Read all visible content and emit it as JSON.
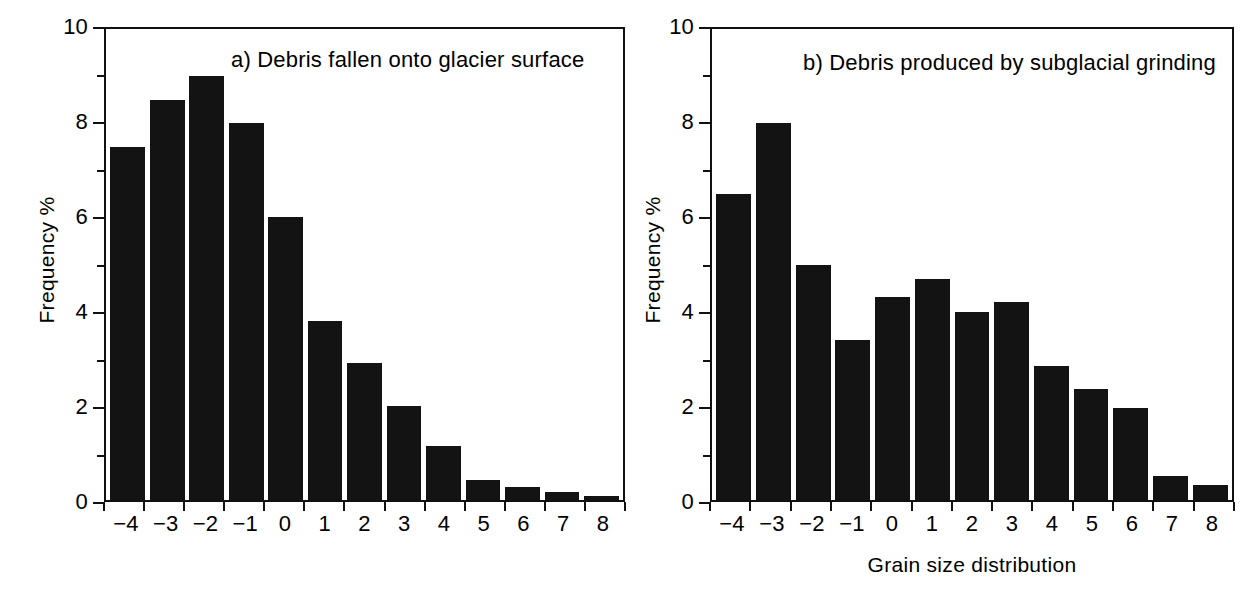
{
  "figure": {
    "background": "#ffffff",
    "bar_color": "#131313",
    "axis_color": "#111111"
  },
  "chart_data": [
    {
      "type": "bar",
      "title": "a) Debris fallen onto glacier surface",
      "panel_letter": "a)",
      "xlabel": "",
      "ylabel": "Frequency %",
      "categories": [
        "-4",
        "-3",
        "-2",
        "-1",
        "0",
        "1",
        "2",
        "3",
        "4",
        "5",
        "6",
        "7",
        "8"
      ],
      "values": [
        7.5,
        8.5,
        9.0,
        8.0,
        6.0,
        3.8,
        2.9,
        2.0,
        1.15,
        0.42,
        0.28,
        0.17,
        0.08
      ],
      "ylim": [
        0,
        10
      ],
      "ytick_major": [
        0,
        2,
        4,
        6,
        8,
        10
      ],
      "ytick_minor": [
        1,
        3,
        5,
        7,
        9
      ],
      "ytick_labels": [
        "0",
        "2",
        "4",
        "6",
        "8",
        "10"
      ],
      "grid": false,
      "legend": "none"
    },
    {
      "type": "bar",
      "title": "b) Debris produced by subglacial grinding",
      "panel_letter": "b)",
      "xlabel": "Grain size distribution",
      "ylabel": "Frequency %",
      "categories": [
        "-4",
        "-3",
        "-2",
        "-1",
        "0",
        "1",
        "2",
        "3",
        "4",
        "5",
        "6",
        "7",
        "8"
      ],
      "values": [
        6.5,
        8.0,
        5.0,
        3.4,
        4.3,
        4.7,
        4.0,
        4.2,
        2.85,
        2.35,
        1.95,
        0.52,
        0.32
      ],
      "ylim": [
        0,
        10
      ],
      "ytick_major": [
        0,
        2,
        4,
        6,
        8,
        10
      ],
      "ytick_minor": [
        1,
        3,
        5,
        7,
        9
      ],
      "ytick_labels": [
        "0",
        "2",
        "4",
        "6",
        "8",
        "10"
      ],
      "grid": false,
      "legend": "none"
    }
  ],
  "caption_remnant": ""
}
